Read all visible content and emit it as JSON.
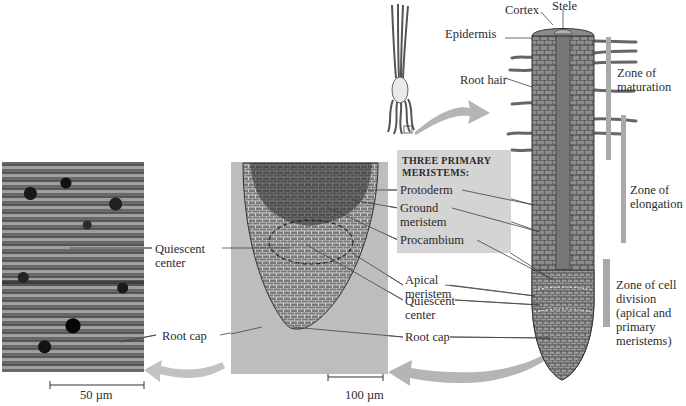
{
  "figure": {
    "meristems_box": {
      "heading": "THREE PRIMARY MERISTEMS:",
      "items": [
        "Protoderm",
        "Ground meristem",
        "Procambium"
      ]
    },
    "micrograph_left": {
      "labels": {
        "quiescent_center": "Quiescent center",
        "root_cap": "Root cap"
      },
      "scale_bar": "50 µm"
    },
    "micrograph_middle": {
      "labels": {
        "apical_meristem": "Apical meristem",
        "quiescent_center": "Quiescent center",
        "root_cap": "Root cap"
      },
      "scale_bar": "100 µm"
    },
    "root_drawing": {
      "labels": {
        "cortex": "Cortex",
        "stele": "Stele",
        "epidermis": "Epidermis",
        "root_hair": "Root hair"
      },
      "zones": [
        "Zone of maturation",
        "Zone of elongation",
        "Zone of cell division (apical and primary meristems)"
      ]
    },
    "colors": {
      "panel_gray": "#d4d4d4",
      "arrow_gray": "#b5b5b5",
      "zone_bar": "#a9a9a9"
    }
  }
}
